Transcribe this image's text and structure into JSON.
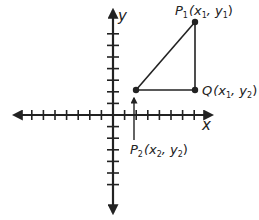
{
  "diagram": {
    "type": "coordinate-plane-right-triangle",
    "colors": {
      "ink": "#222222",
      "background": "#ffffff"
    },
    "axes": {
      "x_label": "x",
      "y_label": "y",
      "origin_px": [
        113,
        115
      ],
      "tick_spacing_px": 11.6,
      "x_ticks_negative": 7,
      "x_ticks_positive": 7,
      "y_ticks_positive": 7,
      "y_ticks_negative": 6
    },
    "points": {
      "p1": {
        "name": "P",
        "sub": "1",
        "coords_text": "(x",
        "c1_sub": "1",
        "sep": ", y",
        "c2_sub": "1",
        "close": ")",
        "px": [
          195,
          22
        ]
      },
      "q": {
        "name": "Q",
        "coords_text": "(x",
        "c1_sub": "1",
        "sep": ", y",
        "c2_sub": "2",
        "close": ")",
        "px": [
          195,
          90
        ]
      },
      "p2": {
        "name": "P",
        "sub": "2",
        "coords_text": "(x",
        "c1_sub": "2",
        "sep": ", y",
        "c2_sub": "2",
        "close": ")",
        "px": [
          136,
          90
        ]
      }
    }
  }
}
